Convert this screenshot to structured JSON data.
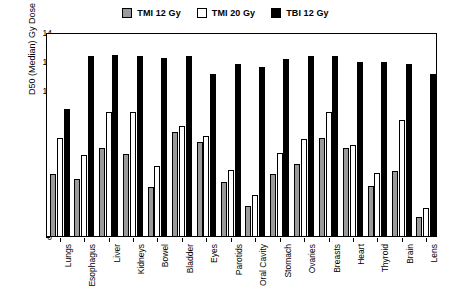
{
  "chart_data": {
    "type": "bar",
    "title": "",
    "xlabel": "",
    "ylabel": "D50 (Median) Gy Dose",
    "ylim": [
      0,
      14
    ],
    "yticks": [
      0,
      2,
      4,
      6,
      8,
      10,
      12,
      14
    ],
    "grid": false,
    "legend_position": "top-center",
    "categories": [
      "Lungs",
      "Esophagus",
      "Liver",
      "Kidneys",
      "Bowel",
      "Bladder",
      "Eyes",
      "Parotids",
      "Oral Cavity",
      "Stomach",
      "Ovaries",
      "Breasts",
      "Heart",
      "Thyroid",
      "Brain",
      "Lens"
    ],
    "series": [
      {
        "name": "TMI 12 Gy",
        "color": "#9a9a9a",
        "values": [
          4.3,
          4.0,
          6.1,
          5.7,
          3.4,
          7.2,
          6.5,
          3.8,
          2.1,
          4.3,
          5.0,
          6.8,
          6.1,
          3.5,
          4.5,
          1.4
        ]
      },
      {
        "name": "TMI 20 Gy",
        "color": "#ffffff",
        "values": [
          6.8,
          5.6,
          8.6,
          8.6,
          4.9,
          7.6,
          6.9,
          4.6,
          2.9,
          5.8,
          6.7,
          8.6,
          6.3,
          4.4,
          8.0,
          2.0
        ]
      },
      {
        "name": "TBI 12 Gy",
        "color": "#000000",
        "values": [
          8.8,
          12.4,
          12.5,
          12.4,
          12.3,
          12.4,
          11.2,
          11.9,
          11.7,
          12.2,
          12.4,
          12.4,
          12.0,
          12.0,
          11.9,
          11.2
        ]
      }
    ]
  },
  "legend": {
    "items": [
      {
        "label": "TMI 12 Gy",
        "swatch": "#9a9a9a"
      },
      {
        "label": "TMI 20 Gy",
        "swatch": "#ffffff"
      },
      {
        "label": "TBI 12 Gy",
        "swatch": "#000000"
      }
    ]
  }
}
